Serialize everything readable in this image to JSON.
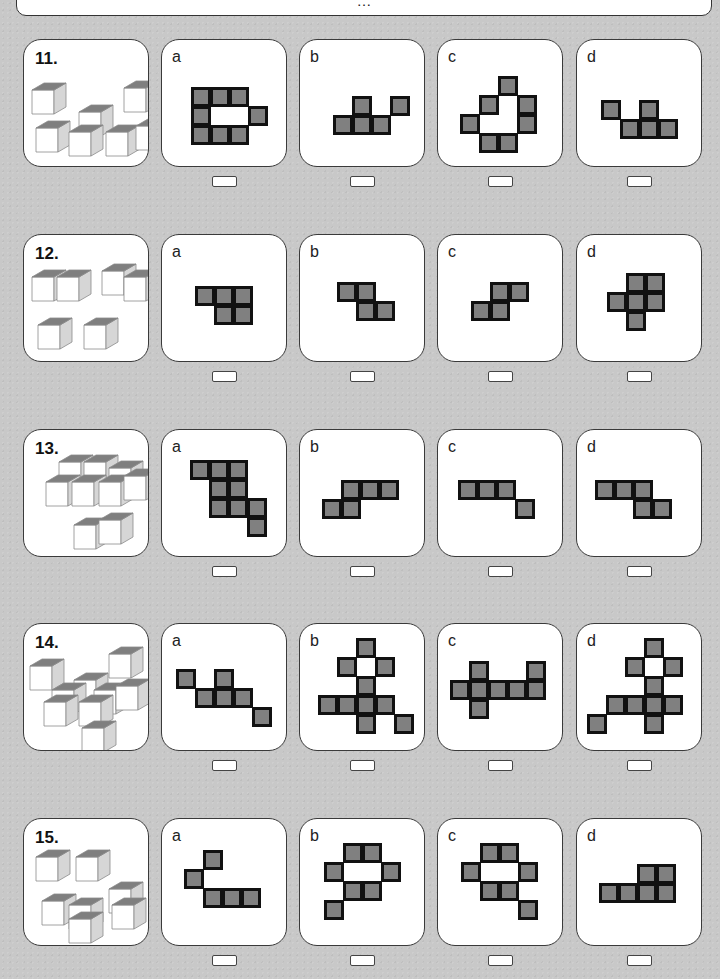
{
  "header": {
    "text": "…"
  },
  "colors": {
    "cell_fill": "#808080",
    "cell_border": "#111111",
    "cube_top": "#7f7f7f",
    "cube_front": "#ffffff",
    "cube_side": "#d6d6d6",
    "cube_edge": "#8a8a8a"
  },
  "problems": [
    {
      "number": "11.",
      "top": 39,
      "cubes": [
        [
          8,
          50
        ],
        [
          100,
          48
        ],
        [
          55,
          72
        ],
        [
          12,
          88
        ],
        [
          45,
          92
        ],
        [
          82,
          92
        ],
        [
          112,
          86
        ]
      ],
      "options": [
        {
          "label": "a",
          "ox": 29,
          "oy": 47,
          "rows": [
            "###.",
            "#..#",
            "###."
          ]
        },
        {
          "label": "b",
          "ox": 33,
          "oy": 56,
          "rows": [
            ".#.#",
            "###."
          ]
        },
        {
          "label": "c",
          "ox": 22,
          "oy": 36,
          "rows": [
            ".#..",
            "#.#.",
            "#..#",
            ".#.#",
            "##.."
          ],
          "fixed": [
            [
              2,
              0
            ],
            [
              1,
              1
            ],
            [
              3,
              1
            ],
            [
              0,
              2
            ],
            [
              3,
              2
            ],
            [
              1,
              3
            ],
            [
              2,
              3
            ]
          ]
        },
        {
          "label": "d",
          "ox": 24,
          "oy": 60,
          "rows": [
            "#.#.",
            ".###"
          ]
        }
      ]
    },
    {
      "number": "12.",
      "top": 234,
      "cubes": [
        [
          8,
          42
        ],
        [
          33,
          42
        ],
        [
          78,
          36
        ],
        [
          100,
          42
        ],
        [
          14,
          90
        ],
        [
          60,
          90
        ]
      ],
      "options": [
        {
          "label": "a",
          "ox": 33,
          "oy": 51,
          "rows": [
            "###",
            ".##"
          ]
        },
        {
          "label": "b",
          "ox": 37,
          "oy": 47,
          "rows": [
            "##.",
            ".##"
          ]
        },
        {
          "label": "c",
          "ox": 33,
          "oy": 47,
          "rows": [
            ".##",
            "##."
          ]
        },
        {
          "label": "d",
          "ox": 30,
          "oy": 38,
          "rows": [
            ".##",
            "###",
            ".#."
          ]
        }
      ]
    },
    {
      "number": "13.",
      "top": 429,
      "cubes": [
        [
          35,
          32
        ],
        [
          60,
          32
        ],
        [
          85,
          38
        ],
        [
          22,
          52
        ],
        [
          48,
          52
        ],
        [
          75,
          52
        ],
        [
          100,
          46
        ],
        [
          50,
          95
        ],
        [
          75,
          90
        ]
      ],
      "options": [
        {
          "label": "a",
          "ox": 28,
          "oy": 30,
          "rows": [
            "###.",
            ".##.",
            ".###",
            "...#"
          ]
        },
        {
          "label": "b",
          "ox": 22,
          "oy": 50,
          "rows": [
            ".###",
            "##.."
          ]
        },
        {
          "label": "c",
          "ox": 20,
          "oy": 50,
          "rows": [
            "###.",
            "...#"
          ]
        },
        {
          "label": "d",
          "ox": 18,
          "oy": 50,
          "rows": [
            "###.",
            "..##"
          ]
        }
      ]
    },
    {
      "number": "14.",
      "top": 623,
      "cubes": [
        [
          6,
          42
        ],
        [
          85,
          30
        ],
        [
          50,
          56
        ],
        [
          28,
          66
        ],
        [
          70,
          66
        ],
        [
          92,
          62
        ],
        [
          20,
          78
        ],
        [
          55,
          78
        ],
        [
          58,
          104
        ]
      ],
      "options": [
        {
          "label": "a",
          "ox": 14,
          "oy": 45,
          "rows": [
            "#.#..",
            ".###.",
            "....#"
          ]
        },
        {
          "label": "b",
          "ox": 18,
          "oy": 14,
          "rows": [
            "..#..",
            ".#.#.",
            "..#..",
            "####.",
            "..#.#"
          ]
        },
        {
          "label": "c",
          "ox": 12,
          "oy": 37,
          "rows": [
            ".#..#",
            "#####",
            ".#..."
          ]
        },
        {
          "label": "d",
          "ox": 10,
          "oy": 14,
          "rows": [
            "...#.",
            "..#.#",
            "...#.",
            ".####",
            "#..#."
          ]
        }
      ]
    },
    {
      "number": "15.",
      "top": 818,
      "cubes": [
        [
          12,
          38
        ],
        [
          52,
          38
        ],
        [
          85,
          70
        ],
        [
          18,
          82
        ],
        [
          45,
          86
        ],
        [
          88,
          86
        ],
        [
          45,
          100
        ]
      ],
      "options": [
        {
          "label": "a",
          "ox": 22,
          "oy": 31,
          "rows": [
            ".#..",
            "#...",
            ".###"
          ]
        },
        {
          "label": "b",
          "ox": 24,
          "oy": 24,
          "rows": [
            ".##.",
            "#..#",
            ".##.",
            "#..."
          ]
        },
        {
          "label": "c",
          "ox": 23,
          "oy": 24,
          "rows": [
            ".##.",
            "#..#",
            ".##.",
            "...#"
          ]
        },
        {
          "label": "d",
          "ox": 22,
          "oy": 45,
          "rows": [
            "..##",
            "####"
          ]
        }
      ]
    }
  ],
  "layout": {
    "card_lefts": [
      23,
      161,
      299,
      437,
      576
    ],
    "answer_offset_x": 51
  }
}
